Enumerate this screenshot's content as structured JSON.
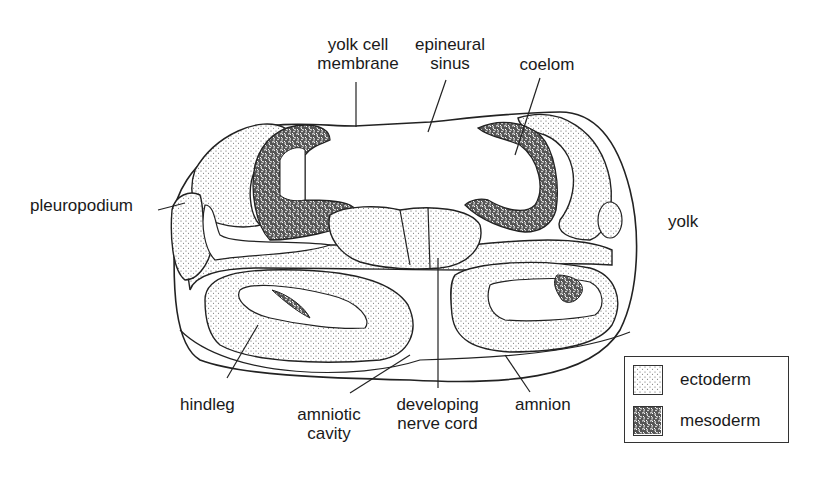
{
  "figure": {
    "labels": {
      "yolk_cell_membrane": "yolk cell\nmembrane",
      "yolk_cell_line1": "yolk cell",
      "yolk_cell_line2": "membrane",
      "epineural_line1": "epineural",
      "epineural_line2": "sinus",
      "coelom": "coelom",
      "pleuropodium": "pleuropodium",
      "yolk": "yolk",
      "hindleg": "hindleg",
      "amniotic_line1": "amniotic",
      "amniotic_line2": "cavity",
      "developing_line1": "developing",
      "developing_line2": "nerve cord",
      "amnion": "amnion"
    },
    "legend": {
      "items": [
        {
          "label": "ectoderm",
          "pattern": "fine-stipple"
        },
        {
          "label": "mesoderm",
          "pattern": "dense-reticulate"
        }
      ]
    },
    "colors": {
      "ink": "#1a1a1a",
      "background": "#ffffff"
    }
  }
}
